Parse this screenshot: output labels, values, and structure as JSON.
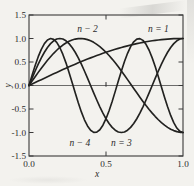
{
  "figure": {
    "background": "#f3f2ee",
    "ink": "#2b2b2b",
    "frame_color": "#3a3a3a"
  },
  "chart_data": {
    "type": "line",
    "title": "",
    "xlabel": "x",
    "ylabel": "y",
    "xlim": [
      0,
      1
    ],
    "ylim": [
      -1.5,
      1.5
    ],
    "grid": false,
    "legend_position": "none",
    "frame": "full-box with inward ticks",
    "zero_line": true,
    "zero_line_center_tick_x": 0.5,
    "x_ticks": [
      {
        "v": 0.0,
        "label": "0.0"
      },
      {
        "v": 0.5,
        "label": "0.5"
      },
      {
        "v": 1.0,
        "label": "1.0"
      }
    ],
    "y_ticks": [
      {
        "v": 1.5,
        "label": "1.5"
      },
      {
        "v": 1.0,
        "label": "1.0"
      },
      {
        "v": 0.5,
        "label": "0.5"
      },
      {
        "v": 0.0,
        "label": "0.0"
      },
      {
        "v": -0.5,
        "label": "-0.5"
      },
      {
        "v": -1.0,
        "label": "-1.0"
      },
      {
        "v": -1.5,
        "label": "-1.5"
      }
    ],
    "x": [
      0,
      0.02,
      0.04,
      0.06,
      0.08,
      0.1,
      0.12,
      0.14,
      0.16,
      0.18,
      0.2,
      0.22,
      0.24,
      0.26,
      0.28,
      0.3,
      0.32,
      0.34,
      0.36,
      0.38,
      0.4,
      0.42,
      0.44,
      0.46,
      0.48,
      0.5,
      0.52,
      0.54,
      0.56,
      0.58,
      0.6,
      0.62,
      0.64,
      0.66,
      0.68,
      0.7,
      0.72,
      0.74,
      0.76,
      0.78,
      0.8,
      0.82,
      0.84,
      0.86,
      0.88,
      0.9,
      0.92,
      0.94,
      0.96,
      0.98,
      1
    ],
    "series": [
      {
        "name": "n = 1",
        "values": [
          0,
          0.031,
          0.063,
          0.094,
          0.125,
          0.156,
          0.187,
          0.218,
          0.249,
          0.279,
          0.309,
          0.339,
          0.368,
          0.397,
          0.426,
          0.454,
          0.482,
          0.509,
          0.536,
          0.562,
          0.588,
          0.613,
          0.637,
          0.661,
          0.685,
          0.707,
          0.729,
          0.75,
          0.77,
          0.79,
          0.809,
          0.827,
          0.844,
          0.861,
          0.876,
          0.891,
          0.905,
          0.918,
          0.93,
          0.941,
          0.951,
          0.96,
          0.969,
          0.976,
          0.982,
          0.988,
          0.992,
          0.996,
          0.998,
          0.999,
          1
        ]
      },
      {
        "name": "n = 2",
        "values": [
          0,
          0.094,
          0.187,
          0.279,
          0.368,
          0.454,
          0.536,
          0.613,
          0.685,
          0.75,
          0.809,
          0.861,
          0.905,
          0.941,
          0.969,
          0.988,
          0.998,
          1,
          0.992,
          0.976,
          0.951,
          0.918,
          0.876,
          0.827,
          0.77,
          0.707,
          0.637,
          0.562,
          0.482,
          0.397,
          0.309,
          0.218,
          0.125,
          0.031,
          -0.063,
          -0.156,
          -0.249,
          -0.339,
          -0.426,
          -0.509,
          -0.588,
          -0.661,
          -0.729,
          -0.79,
          -0.844,
          -0.891,
          -0.93,
          -0.96,
          -0.982,
          -0.996,
          -1
        ]
      },
      {
        "name": "n = 3",
        "values": [
          0,
          0.156,
          0.309,
          0.454,
          0.588,
          0.707,
          0.809,
          0.891,
          0.951,
          0.988,
          1,
          0.988,
          0.951,
          0.891,
          0.809,
          0.707,
          0.588,
          0.454,
          0.309,
          0.156,
          0,
          -0.156,
          -0.309,
          -0.454,
          -0.588,
          -0.707,
          -0.809,
          -0.891,
          -0.951,
          -0.988,
          -1,
          -0.988,
          -0.951,
          -0.891,
          -0.809,
          -0.707,
          -0.588,
          -0.454,
          -0.309,
          -0.156,
          0,
          0.156,
          0.309,
          0.454,
          0.588,
          0.707,
          0.809,
          0.891,
          0.951,
          0.988,
          1
        ]
      },
      {
        "name": "n = 4",
        "values": [
          0,
          0.218,
          0.426,
          0.613,
          0.77,
          0.891,
          0.969,
          1,
          0.982,
          0.918,
          0.809,
          0.661,
          0.482,
          0.279,
          0.063,
          -0.156,
          -0.368,
          -0.562,
          -0.729,
          -0.861,
          -0.951,
          -0.996,
          -0.992,
          -0.941,
          -0.844,
          -0.707,
          -0.536,
          -0.339,
          -0.125,
          0.094,
          0.309,
          0.509,
          0.685,
          0.827,
          0.93,
          0.988,
          0.998,
          0.96,
          0.876,
          0.75,
          0.588,
          0.397,
          0.187,
          -0.031,
          -0.249,
          -0.454,
          -0.637,
          -0.79,
          -0.905,
          -0.976,
          -1
        ]
      }
    ],
    "annotations": [
      {
        "text": "n − 2",
        "x": 0.38,
        "y": 1.21
      },
      {
        "text": "n = 1",
        "x": 0.84,
        "y": 1.21
      },
      {
        "text": "n − 4",
        "x": 0.33,
        "y": -1.22
      },
      {
        "text": "n = 3",
        "x": 0.6,
        "y": -1.22
      }
    ]
  }
}
